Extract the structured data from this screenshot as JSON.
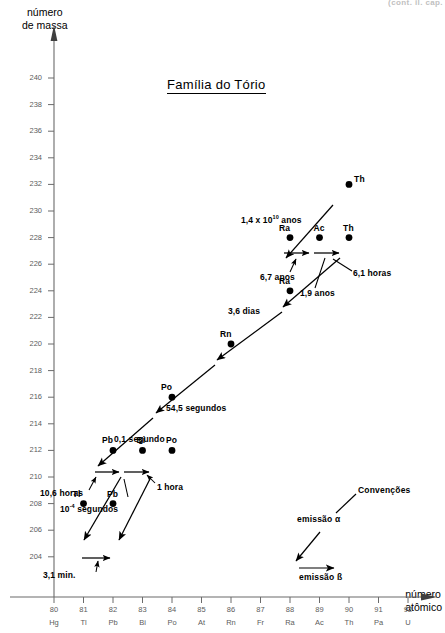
{
  "clipped_header": "(cont. il.  cap.",
  "title": "Família do Tório",
  "axes": {
    "y_label_line1": "número",
    "y_label_line2": "de massa",
    "x_label_line1": "número",
    "x_label_line2": "atômico",
    "y_ticks": [
      240,
      238,
      236,
      234,
      232,
      230,
      228,
      226,
      224,
      222,
      220,
      218,
      216,
      214,
      212,
      210,
      208,
      206,
      204
    ],
    "x_numbers": [
      80,
      81,
      82,
      83,
      84,
      85,
      86,
      87,
      88,
      89,
      90,
      91,
      92
    ],
    "x_symbols": [
      "Hg",
      "Tl",
      "Pb",
      "Bi",
      "Po",
      "At",
      "Rn",
      "Fr",
      "Ra",
      "Ac",
      "Th",
      "Pa",
      "U"
    ]
  },
  "legend": {
    "title": "Convenções",
    "alpha_label": "emissão α",
    "beta_label": "emissão ß"
  },
  "nuclides": [
    {
      "symbol": "Th",
      "z": 90,
      "a": 232,
      "label_pos": "right"
    },
    {
      "symbol": "Ra",
      "z": 88,
      "a": 228,
      "label_pos": "above-left"
    },
    {
      "symbol": "Ac",
      "z": 89,
      "a": 228,
      "label_pos": "above"
    },
    {
      "symbol": "Th",
      "z": 90,
      "a": 228,
      "label_pos": "above"
    },
    {
      "symbol": "Ra",
      "z": 88,
      "a": 224,
      "label_pos": "above-left"
    },
    {
      "symbol": "Rn",
      "z": 86,
      "a": 220,
      "label_pos": "above-left"
    },
    {
      "symbol": "Po",
      "z": 84,
      "a": 216,
      "label_pos": "above-left"
    },
    {
      "symbol": "Pb",
      "z": 82,
      "a": 212,
      "label_pos": "above-left"
    },
    {
      "symbol": "Bi",
      "z": 83,
      "a": 212,
      "label_pos": "above"
    },
    {
      "symbol": "Po",
      "z": 84,
      "a": 212,
      "label_pos": "above"
    },
    {
      "symbol": "Tl",
      "z": 81,
      "a": 208,
      "label_pos": "above-left"
    },
    {
      "symbol": "Pb",
      "z": 82,
      "a": 208,
      "label_pos": "above"
    }
  ],
  "half_lives": {
    "th232": "1,4 x 10",
    "th232_exp": "10",
    "th232_unit": " anos",
    "ra228": "6,7 anos",
    "ac228": "1,9 anos",
    "th228": "6,1 horas",
    "ra224": "3,6 dias",
    "rn220": "54,5 segundos",
    "po216": "0,1 segundo",
    "pb212": "10,6 horas",
    "bi212_alpha": "10",
    "bi212_exp": "-4",
    "bi212_unit": " segundos",
    "po212": "1 hora",
    "tl208": "3,1 min."
  },
  "chart_data": {
    "type": "scatter",
    "title": "Família do Tório",
    "xlabel": "número atômico",
    "ylabel": "número de massa",
    "xlim": [
      80,
      92
    ],
    "ylim": [
      204,
      241
    ],
    "grid": false,
    "legend_position": "lower-right",
    "points": [
      {
        "x": 90,
        "y": 232,
        "label": "Th"
      },
      {
        "x": 88,
        "y": 228,
        "label": "Ra"
      },
      {
        "x": 89,
        "y": 228,
        "label": "Ac"
      },
      {
        "x": 90,
        "y": 228,
        "label": "Th"
      },
      {
        "x": 88,
        "y": 224,
        "label": "Ra"
      },
      {
        "x": 86,
        "y": 220,
        "label": "Rn"
      },
      {
        "x": 84,
        "y": 216,
        "label": "Po"
      },
      {
        "x": 82,
        "y": 212,
        "label": "Pb"
      },
      {
        "x": 83,
        "y": 212,
        "label": "Bi"
      },
      {
        "x": 84,
        "y": 212,
        "label": "Po"
      },
      {
        "x": 81,
        "y": 208,
        "label": "Tl"
      },
      {
        "x": 82,
        "y": 208,
        "label": "Pb"
      }
    ],
    "decays": [
      {
        "from": [
          90,
          232
        ],
        "to": [
          88,
          228
        ],
        "type": "alpha",
        "half_life": "1,4 x 10^10 anos"
      },
      {
        "from": [
          88,
          228
        ],
        "to": [
          89,
          228
        ],
        "type": "beta",
        "half_life": "6,7 anos"
      },
      {
        "from": [
          89,
          228
        ],
        "to": [
          90,
          228
        ],
        "type": "beta",
        "half_life": "1,9 anos"
      },
      {
        "from": [
          90,
          228
        ],
        "to": [
          88,
          224
        ],
        "type": "alpha",
        "half_life": "6,1 horas"
      },
      {
        "from": [
          88,
          224
        ],
        "to": [
          86,
          220
        ],
        "type": "alpha",
        "half_life": "3,6 dias"
      },
      {
        "from": [
          86,
          220
        ],
        "to": [
          84,
          216
        ],
        "type": "alpha",
        "half_life": "54,5 segundos"
      },
      {
        "from": [
          84,
          216
        ],
        "to": [
          82,
          212
        ],
        "type": "alpha",
        "half_life": "0,1 segundo"
      },
      {
        "from": [
          82,
          212
        ],
        "to": [
          83,
          212
        ],
        "type": "beta",
        "half_life": "10,6 horas"
      },
      {
        "from": [
          83,
          212
        ],
        "to": [
          84,
          212
        ],
        "type": "beta",
        "half_life": "10^-4 segundos"
      },
      {
        "from": [
          83,
          212
        ],
        "to": [
          81,
          208
        ],
        "type": "alpha",
        "half_life": "10^-4 segundos"
      },
      {
        "from": [
          84,
          212
        ],
        "to": [
          82,
          208
        ],
        "type": "alpha",
        "half_life": "1 hora"
      },
      {
        "from": [
          81,
          208
        ],
        "to": [
          82,
          208
        ],
        "type": "beta",
        "half_life": "3,1 min."
      }
    ]
  }
}
